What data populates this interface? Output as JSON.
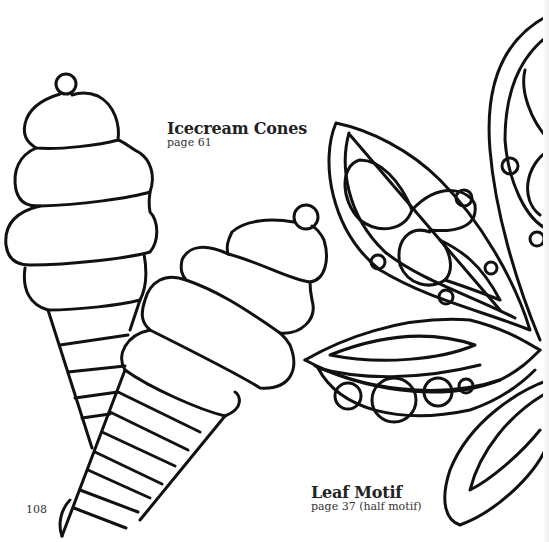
{
  "page": {
    "page_number": "108",
    "background_color": "#ffffff",
    "line_color": "#111111"
  },
  "patterns": [
    {
      "title": "Icecream Cones",
      "reference": "page 61",
      "icon": "icecream-cone-outline"
    },
    {
      "title": "Leaf Motif",
      "reference": "page 37 (half motif)",
      "icon": "leaf-motif-outline"
    }
  ]
}
